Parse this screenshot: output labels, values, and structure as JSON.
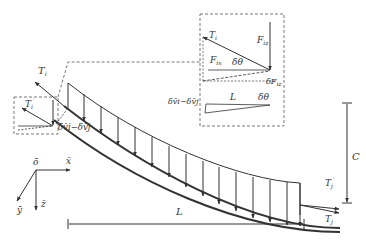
{
  "figure": {
    "colors": {
      "line": "#333333",
      "dashed": "#555555",
      "background": "#ffffff"
    }
  },
  "labels": {
    "T_i_main": {
      "base": "T",
      "sub": "i"
    },
    "T_i_prime_left": {
      "base": "T",
      "sub": "i",
      "sup": "′"
    },
    "T_j_prime_right": {
      "base": "T",
      "sub": "j",
      "sup": "′"
    },
    "T_j_right": {
      "base": "T",
      "sub": "j"
    },
    "delta_v_main": "δv̄i−δv̄j",
    "delta_v_inset": "δv̄i−δv̄j",
    "C": "C",
    "L_bottom": "L",
    "L_inset": "L"
  },
  "inset": {
    "T_i": {
      "base": "T",
      "sub": "i"
    },
    "F_iz": {
      "base": "F",
      "sub": "iz"
    },
    "F_ix": {
      "base": "F",
      "sub": "ix"
    },
    "delta_theta": "δθ",
    "delta_F_iz": {
      "base": "δF",
      "sub": "iz"
    },
    "delta_theta_small": "δθ"
  },
  "axes": {
    "origin": "ō",
    "x": "x̄",
    "y": "ȳ",
    "z": "z̄"
  }
}
